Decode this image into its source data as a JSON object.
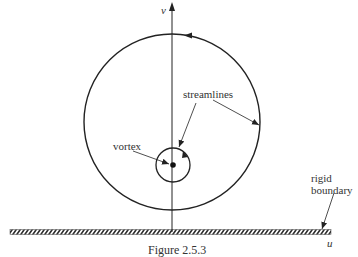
{
  "diagram": {
    "axes": {
      "vertical": "v",
      "horizontal": "u"
    },
    "labels": {
      "streamlines": "streamlines",
      "vortex": "vortex",
      "rigid_line1": "rigid",
      "rigid_line2": "boundary"
    },
    "caption": "Figure 2.5.3",
    "elements": {
      "outer_streamline": {
        "cx": 172,
        "cy": 122,
        "r": 88,
        "direction": "counterclockwise"
      },
      "inner_streamline": {
        "cx": 173,
        "cy": 165,
        "r": 17
      },
      "vortex_point": {
        "cx": 173,
        "cy": 165
      },
      "boundary": {
        "x1": 10,
        "x2": 331,
        "y": 232
      }
    },
    "colors": {
      "line": "#222222",
      "background": "#ffffff"
    }
  }
}
